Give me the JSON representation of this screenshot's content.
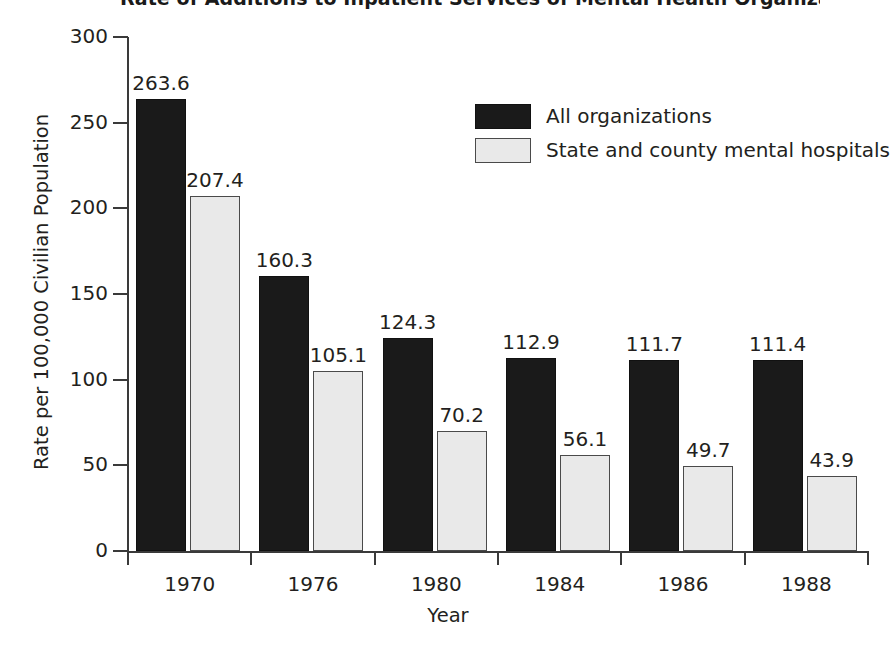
{
  "chart_data": {
    "type": "bar",
    "title": "Rate of Additions to Inpatient Services of Mental Health Organizations",
    "xlabel": "Year",
    "ylabel": "Rate per 100,000 Civilian Population",
    "categories": [
      "1970",
      "1976",
      "1980",
      "1984",
      "1986",
      "1988"
    ],
    "series": [
      {
        "name": "All organizations",
        "color": "#1a1a1a",
        "values": [
          263.6,
          160.3,
          124.3,
          112.9,
          111.7,
          111.4
        ],
        "labels": [
          "263.6",
          "160.3",
          "124.3",
          "112.9",
          "111.7",
          "111.4"
        ]
      },
      {
        "name": "State and county mental hospitals",
        "color": "#e9e9e9",
        "values": [
          207.4,
          105.1,
          70.2,
          56.1,
          49.7,
          43.9
        ],
        "labels": [
          "207.4",
          "105.1",
          "70.2",
          "56.1",
          "49.7",
          "43.9"
        ]
      }
    ],
    "ylim": [
      0,
      300
    ],
    "yticks": [
      0,
      50,
      100,
      150,
      200,
      250,
      300
    ],
    "ytick_labels": [
      "0",
      "50",
      "100",
      "150",
      "200",
      "250",
      "300"
    ],
    "grid": false,
    "legend_position": "upper-right-inside"
  },
  "legend": {
    "entries": [
      {
        "label": "All organizations"
      },
      {
        "label": "State and county mental hospitals"
      }
    ]
  }
}
